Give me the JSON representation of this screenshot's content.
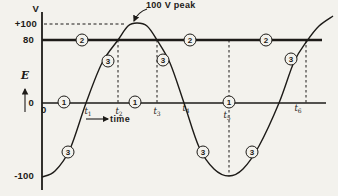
{
  "colors": {
    "bg": "#f3f2ed",
    "ink": "#1d1b18"
  },
  "axis_labels": {
    "v_unit": "V",
    "plus100": "+100",
    "v80": "80",
    "zero_y": "0",
    "minus100": "-100",
    "origin_zero": "0",
    "e_symbol": "E",
    "time": "time"
  },
  "annotation": {
    "peak_label": "100 V peak"
  },
  "t_ticks": [
    {
      "base": "t",
      "sub": "1",
      "x": 88,
      "y": 107
    },
    {
      "base": "t",
      "sub": "2",
      "x": 119,
      "y": 107
    },
    {
      "base": "t",
      "sub": "3",
      "x": 157,
      "y": 107
    },
    {
      "base": "t",
      "sub": "4",
      "x": 186,
      "y": 104
    },
    {
      "base": "t",
      "sub": "5",
      "x": 227,
      "y": 111
    },
    {
      "base": "t",
      "sub": "6",
      "x": 298,
      "y": 104
    }
  ],
  "markers": [
    {
      "label": "1",
      "x": 64,
      "y": 102
    },
    {
      "label": "1",
      "x": 135,
      "y": 102
    },
    {
      "label": "1",
      "x": 229,
      "y": 102
    },
    {
      "label": "2",
      "x": 82,
      "y": 40
    },
    {
      "label": "2",
      "x": 190,
      "y": 40
    },
    {
      "label": "2",
      "x": 266,
      "y": 40
    },
    {
      "label": "3",
      "x": 68,
      "y": 152
    },
    {
      "label": "3",
      "x": 108,
      "y": 61
    },
    {
      "label": "3",
      "x": 163,
      "y": 60
    },
    {
      "label": "3",
      "x": 203,
      "y": 152
    },
    {
      "label": "3",
      "x": 252,
      "y": 152
    },
    {
      "label": "3",
      "x": 291,
      "y": 59
    }
  ],
  "geometry": {
    "curve_points": [
      [
        42,
        177
      ],
      [
        55,
        171
      ],
      [
        70,
        149
      ],
      [
        86,
        103
      ],
      [
        102,
        63
      ],
      [
        118,
        40
      ],
      [
        128,
        26
      ],
      [
        137,
        23
      ],
      [
        147,
        26
      ],
      [
        157,
        40
      ],
      [
        170,
        63
      ],
      [
        184,
        103
      ],
      [
        199,
        147
      ],
      [
        214,
        169
      ],
      [
        229,
        176
      ],
      [
        243,
        169
      ],
      [
        259,
        146
      ],
      [
        279,
        103
      ],
      [
        294,
        62
      ],
      [
        307,
        41
      ],
      [
        319,
        26
      ],
      [
        333,
        16
      ]
    ],
    "dashed_verticals": [
      {
        "x": 118,
        "y1": 40,
        "y2": 105
      },
      {
        "x": 157,
        "y1": 40,
        "y2": 105
      },
      {
        "x": 229,
        "y1": 40,
        "y2": 176
      },
      {
        "x": 306,
        "y1": 40,
        "y2": 105
      }
    ],
    "dashed_plus100": {
      "y": 24,
      "x1": 44,
      "x2": 124
    },
    "axis_y": {
      "x": 42,
      "y1": 12,
      "y2": 190
    },
    "axis_x": {
      "y": 103,
      "x1": 42,
      "x2": 326
    },
    "line80": {
      "y": 40,
      "x1": 42,
      "x2": 322
    },
    "e_arrow": {
      "x": 25,
      "y1": 112,
      "y2": 89
    },
    "time_arrow": {
      "y": 119,
      "x1": 86,
      "x2": 108
    },
    "peak_arrow": {
      "x1": 147,
      "y1": 9,
      "qx": 138,
      "qy": 12,
      "x2": 134,
      "y2": 21
    }
  },
  "chart_data": {
    "type": "line",
    "xlabel": "time",
    "ylabel": "E (V)",
    "ylim": [
      -100,
      100
    ],
    "x_ticks": [
      "0",
      "t1",
      "t2",
      "t3",
      "t4",
      "t5",
      "t6"
    ],
    "series": [
      {
        "name": "curve-3-sine-wave",
        "x": [
          "0",
          "t1",
          "t2",
          "peak",
          "t3",
          "t4",
          "t5",
          "t6"
        ],
        "values": [
          -100,
          0,
          80,
          100,
          80,
          0,
          -100,
          80
        ]
      },
      {
        "name": "line-2-reference",
        "type": "hline",
        "value": 80
      },
      {
        "name": "line-1-zero-axis",
        "type": "hline",
        "value": 0
      }
    ],
    "annotations": [
      "100 V peak"
    ],
    "guides": {
      "dashed_at_plus100": true,
      "dashed_verticals_at": [
        "t2",
        "t3",
        "t5",
        "t6"
      ]
    },
    "grid": false,
    "legend": "none"
  }
}
